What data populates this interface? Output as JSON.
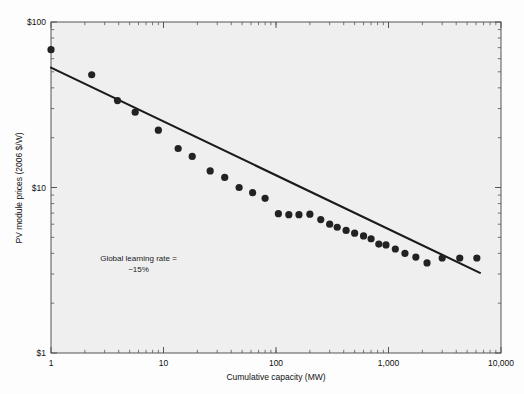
{
  "chart_data": {
    "type": "scatter",
    "title": "",
    "subtitle": "",
    "xlabel": "Cumulative capacity (MW)",
    "ylabel": "PV module prices (2006 $/W)",
    "xscale": "log",
    "yscale": "log",
    "xlim": [
      1,
      10000
    ],
    "ylim": [
      1,
      100
    ],
    "grid": false,
    "legend": null,
    "xticks": [
      1,
      10,
      100,
      1000,
      10000
    ],
    "xticklabels": [
      "1",
      "10",
      "100",
      "1,000",
      "10,000"
    ],
    "yticks": [
      1,
      10,
      100
    ],
    "yticklabels": [
      "$1",
      "$10",
      "$100"
    ],
    "annotations": [
      {
        "name": "learning-rate-annotation",
        "line1": "Global learning rate =",
        "line2": "~15%",
        "x": 6.0,
        "y": 3.6
      }
    ],
    "series": [
      {
        "name": "PV module price observations",
        "type": "scatter",
        "marker": "circle",
        "color": "#222222",
        "points": [
          [
            1.0,
            68.0
          ],
          [
            2.3,
            48.0
          ],
          [
            3.9,
            33.5
          ],
          [
            5.6,
            28.5
          ],
          [
            9.0,
            22.2
          ],
          [
            13.5,
            17.2
          ],
          [
            18.0,
            15.4
          ],
          [
            26.0,
            12.6
          ],
          [
            35.0,
            11.5
          ],
          [
            47.0,
            10.0
          ],
          [
            62.0,
            9.3
          ],
          [
            80.0,
            8.6
          ],
          [
            105.0,
            6.95
          ],
          [
            130.0,
            6.85
          ],
          [
            160.0,
            6.85
          ],
          [
            200.0,
            6.9
          ],
          [
            250.0,
            6.4
          ],
          [
            300.0,
            6.0
          ],
          [
            350.0,
            5.75
          ],
          [
            420.0,
            5.5
          ],
          [
            500.0,
            5.3
          ],
          [
            600.0,
            5.1
          ],
          [
            700.0,
            4.9
          ],
          [
            820.0,
            4.55
          ],
          [
            950.0,
            4.5
          ],
          [
            1150.0,
            4.25
          ],
          [
            1400.0,
            4.0
          ],
          [
            1750.0,
            3.8
          ],
          [
            2200.0,
            3.5
          ],
          [
            3000.0,
            3.75
          ],
          [
            4300.0,
            3.75
          ],
          [
            6100.0,
            3.75
          ]
        ]
      },
      {
        "name": "Experience curve fit",
        "type": "line",
        "color": "#1a1a1a",
        "points": [
          [
            1.0,
            53.0
          ],
          [
            6500.0,
            3.05
          ]
        ]
      }
    ]
  },
  "figure": {
    "plot_background": "#efefef",
    "page_background": "#fdfdfd",
    "frame_color": "#555555",
    "marker_color": "#222222",
    "line_color": "#1a1a1a"
  }
}
